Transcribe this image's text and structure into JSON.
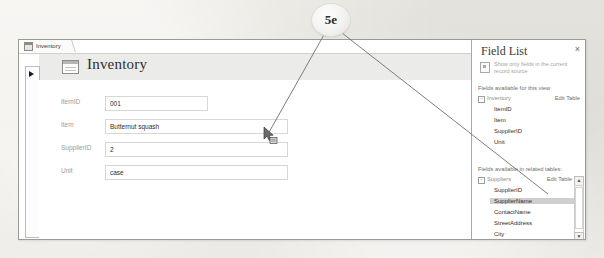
{
  "annotation": {
    "callout_label": "5e"
  },
  "window": {
    "tab": {
      "label": "Inventory",
      "icon": "form-icon",
      "close_label": "×"
    },
    "form": {
      "title": "Inventory",
      "icon": "form-view-icon",
      "fields": [
        {
          "label": "ItemID",
          "value": "001",
          "box_width": 103
        },
        {
          "label": "Item",
          "value": "Butternut squash",
          "box_width": 183
        },
        {
          "label": "SupplierID",
          "value": "2",
          "box_width": 183
        },
        {
          "label": "Unit",
          "value": "case",
          "box_width": 183
        }
      ]
    }
  },
  "field_list": {
    "title": "Field List",
    "close_label": "×",
    "show_only_label": "Show only fields in the current record source",
    "show_only_icon": "filter-icon",
    "current_view_caption": "Fields available for this view",
    "current_view_table": {
      "name": "Inventory",
      "expander": "−",
      "edit_table_label": "Edit Table",
      "fields": [
        "ItemID",
        "Item",
        "SupplierID",
        "Unit"
      ]
    },
    "related_caption": "Fields available in related tables:",
    "related_table": {
      "name": "Suppliers",
      "expander": "−",
      "edit_table_label": "Edit Table",
      "fields": [
        "SupplierID",
        "SupplierName",
        "ContactName",
        "StreetAddress",
        "City",
        "State"
      ],
      "selected_field": "SupplierName"
    },
    "scroll_up_label": "▲",
    "scroll_down_label": "▼"
  },
  "cursor": {
    "name": "drag-field-cursor"
  },
  "colors": {
    "accent_selection": "#cfcfcf",
    "header_band": "#ebebe9",
    "page_background": "#e9e7e2",
    "window_border": "#9a9a96"
  }
}
